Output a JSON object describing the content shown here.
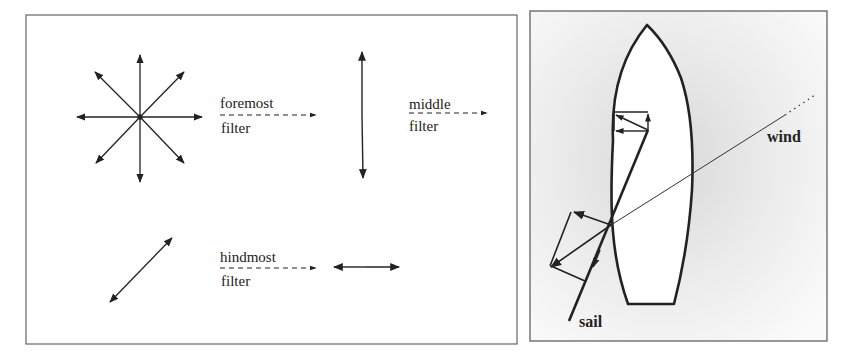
{
  "left_panel": {
    "title": "Polarization filters",
    "filters": [
      {
        "label_top": "foremost",
        "label_bottom": "filter"
      },
      {
        "label_top": "middle",
        "label_bottom": "filter"
      },
      {
        "label_top": "hindmost",
        "label_bottom": "filter"
      }
    ],
    "states": [
      "unpolarized (all directions)",
      "vertical polarization",
      "diagonal polarization",
      "horizontal polarization"
    ]
  },
  "right_panel": {
    "title": "Sailboat force diagram",
    "labels": {
      "wind": "wind",
      "sail": "sail"
    }
  },
  "colors": {
    "line": "#222222",
    "border": "#555555",
    "background": "#ffffff",
    "shade": "#e6e6e6"
  }
}
